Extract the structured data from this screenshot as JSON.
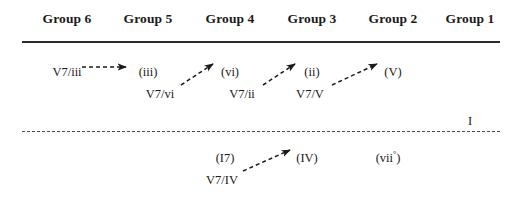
{
  "figure": {
    "header": {
      "groups": [
        {
          "label": "Group 6",
          "x": 67
        },
        {
          "label": "Group 5",
          "x": 148
        },
        {
          "label": "Group 4",
          "x": 230
        },
        {
          "label": "Group 3",
          "x": 312
        },
        {
          "label": "Group 2",
          "x": 393
        },
        {
          "label": "Group 1",
          "x": 470
        }
      ]
    },
    "upper_section": {
      "nodes": [
        {
          "id": "v7-of-iii",
          "label": "V7/iii",
          "x": 67,
          "y": 66
        },
        {
          "id": "iii",
          "label": "(iii)",
          "x": 148,
          "y": 66
        },
        {
          "id": "vi",
          "label": "(vi)",
          "x": 230,
          "y": 66
        },
        {
          "id": "ii",
          "label": "(ii)",
          "x": 312,
          "y": 66
        },
        {
          "id": "V",
          "label": "(V)",
          "x": 393,
          "y": 66
        },
        {
          "id": "v7-of-vi",
          "label": "V7/vi",
          "x": 160,
          "y": 88
        },
        {
          "id": "v7-of-ii",
          "label": "V7/ii",
          "x": 242,
          "y": 88
        },
        {
          "id": "v7-of-V",
          "label": "V7/V",
          "x": 310,
          "y": 88
        },
        {
          "id": "tonic",
          "label": "I",
          "x": 470,
          "y": 115
        }
      ],
      "arrows": [
        {
          "id": "arrow-v7iii-to-iii",
          "x1": 82,
          "y1": 67,
          "x2": 126,
          "y2": 67
        },
        {
          "id": "arrow-v7vi-to-vi",
          "x1": 181,
          "y1": 85,
          "x2": 213,
          "y2": 64
        },
        {
          "id": "arrow-v7ii-to-ii",
          "x1": 263,
          "y1": 85,
          "x2": 295,
          "y2": 64
        },
        {
          "id": "arrow-v7V-to-V",
          "x1": 332,
          "y1": 85,
          "x2": 377,
          "y2": 64
        }
      ]
    },
    "lower_section": {
      "nodes": [
        {
          "id": "I7",
          "label": "(I7)",
          "x": 225,
          "y": 152
        },
        {
          "id": "IV",
          "label": "(IV)",
          "x": 307,
          "y": 152
        },
        {
          "id": "vii-dim",
          "label": "(vii",
          "sup": "°",
          "suffix": ")",
          "x": 388,
          "y": 152
        },
        {
          "id": "v7-of-IV",
          "label": "V7/IV",
          "x": 222,
          "y": 174
        }
      ],
      "arrows": [
        {
          "id": "arrow-v7IV-to-IV",
          "x1": 243,
          "y1": 171,
          "x2": 290,
          "y2": 150
        }
      ]
    },
    "colors": {
      "ink": "#1a1a1a",
      "rule": "#2b2b2b",
      "divider": "#4a4a4a",
      "background": "#ffffff"
    }
  }
}
